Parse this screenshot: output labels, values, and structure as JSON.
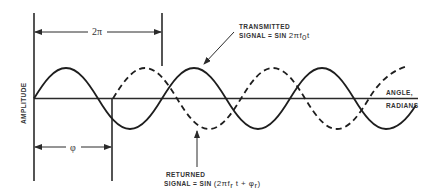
{
  "diagram": {
    "y_axis_label": "AMPLITUDE",
    "x_axis_label_line1": "ANGLE,",
    "x_axis_label_line2": "RADIANS",
    "period_label": "2π",
    "phase_label": "φ",
    "transmitted": {
      "line1": "TRANSMITTED",
      "line2_prefix": "SIGNAL = SIN ",
      "line2_expr": "2πf",
      "line2_sub": "0",
      "line2_suffix": "t"
    },
    "returned": {
      "line1": "RETURNED",
      "line2_prefix": "SIGNAL = SIN ",
      "line2_expr_a": "(2πf",
      "line2_sub_a": "r",
      "line2_expr_b": " t + φ",
      "line2_sub_b": "r",
      "line2_close": ")"
    },
    "colors": {
      "ink": "#1e1e1e",
      "background": "#ffffff"
    }
  }
}
